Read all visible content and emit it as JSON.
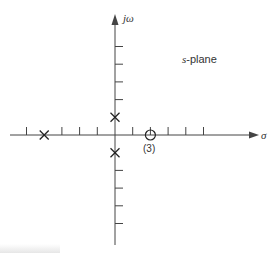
{
  "diagram": {
    "plane_label_prefix": "s",
    "plane_label_suffix": "-plane",
    "axes": {
      "vertical_label": "jω",
      "horizontal_label": "σ"
    },
    "origin": {
      "x": 115,
      "y": 135
    },
    "unit_px": 17.7,
    "real_ticks": [
      -5,
      -3,
      -2,
      -1,
      1,
      2,
      3,
      4,
      5
    ],
    "imag_ticks": [
      5,
      4,
      3,
      2,
      -2,
      -3,
      -4,
      -5
    ],
    "poles": [
      {
        "re": -4,
        "im": 0
      },
      {
        "re": 0,
        "im": 1
      },
      {
        "re": 0,
        "im": -1
      }
    ],
    "zeros": [
      {
        "re": 2,
        "im": 0,
        "multiplicity_label": "(3)"
      }
    ],
    "colors": {
      "line": "#444444",
      "text": "#333333"
    }
  }
}
